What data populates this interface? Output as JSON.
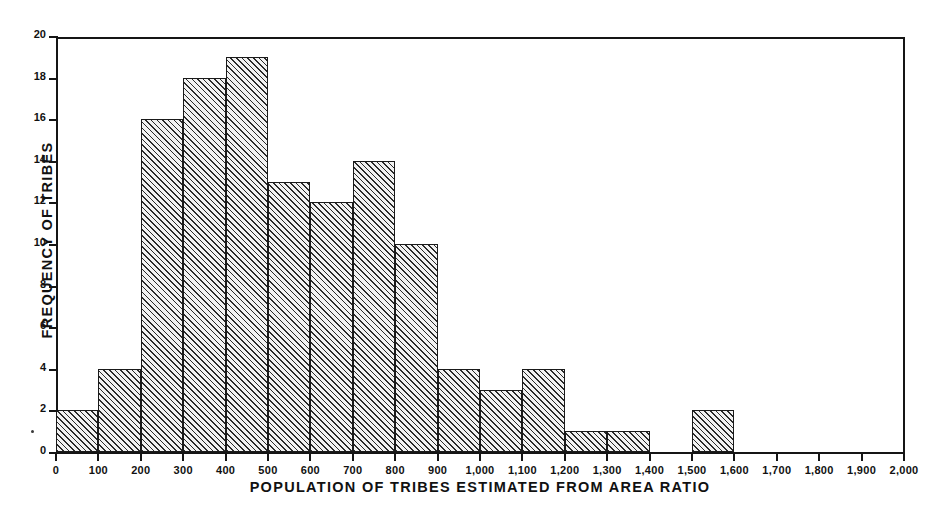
{
  "chart_data": {
    "type": "bar",
    "title": "",
    "xlabel": "POPULATION OF TRIBES ESTIMATED FROM AREA RATIO",
    "ylabel": "FREQUENCY OF TRIBES",
    "xlim": [
      0,
      2000
    ],
    "ylim": [
      0,
      20
    ],
    "bin_width": 100,
    "grid": false,
    "legend": null,
    "x_tick_labels": [
      "0",
      "100",
      "200",
      "300",
      "400",
      "500",
      "600",
      "700",
      "800",
      "900",
      "1,000",
      "1,100",
      "1,200",
      "1,300",
      "1,400",
      "1,500",
      "1,600",
      "1,700",
      "1,800",
      "1,900",
      "2,000"
    ],
    "x_tick_values": [
      0,
      100,
      200,
      300,
      400,
      500,
      600,
      700,
      800,
      900,
      1000,
      1100,
      1200,
      1300,
      1400,
      1500,
      1600,
      1700,
      1800,
      1900,
      2000
    ],
    "y_tick_labels": [
      "0",
      "2",
      "4",
      "6",
      "8",
      "10",
      "12",
      "14",
      "16",
      "18",
      "20"
    ],
    "y_tick_values": [
      0,
      2,
      4,
      6,
      8,
      10,
      12,
      14,
      16,
      18,
      20
    ],
    "categories": [
      "0-100",
      "100-200",
      "200-300",
      "300-400",
      "400-500",
      "500-600",
      "600-700",
      "700-800",
      "800-900",
      "900-1,000",
      "1,000-1,100",
      "1,100-1,200",
      "1,200-1,300",
      "1,300-1,400",
      "1,400-1,500",
      "1,500-1,600",
      "1,600-1,700",
      "1,700-1,800",
      "1,800-1,900",
      "1,900-2,000"
    ],
    "bin_starts": [
      0,
      100,
      200,
      300,
      400,
      500,
      600,
      700,
      800,
      900,
      1000,
      1100,
      1200,
      1300,
      1400,
      1500,
      1600,
      1700,
      1800,
      1900
    ],
    "values": [
      2,
      4,
      16,
      18,
      19,
      13,
      12,
      14,
      10,
      4,
      3,
      4,
      1,
      1,
      0,
      2,
      0,
      0,
      0,
      0
    ],
    "total": 125,
    "colors": {
      "bar_fill": "#f2f2f2",
      "bar_hatch": "#2a2a2a",
      "bar_edge": "#1a1a1a",
      "axis": "#151515",
      "text": "#111111",
      "background": "#ffffff"
    }
  }
}
